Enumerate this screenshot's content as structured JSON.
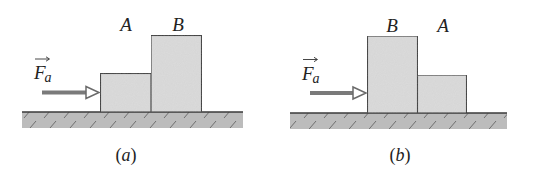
{
  "figure": {
    "colors": {
      "block_fill": "#d9d9d9",
      "block_stroke": "#3a3a3a",
      "ground_fill": "#b8b8b8",
      "hatch": "#6e6e6e",
      "arrow": "#7a7a7a",
      "text": "#222222"
    },
    "panels": [
      {
        "id": "a",
        "caption": "(a)",
        "caption_letter": "a",
        "force_label": "F",
        "force_subscript": "a",
        "blocks": [
          {
            "name": "A",
            "label": "A",
            "size": "small",
            "order": 1
          },
          {
            "name": "B",
            "label": "B",
            "size": "large",
            "order": 2
          }
        ]
      },
      {
        "id": "b",
        "caption": "(b)",
        "caption_letter": "b",
        "force_label": "F",
        "force_subscript": "a",
        "blocks": [
          {
            "name": "B",
            "label": "B",
            "size": "large",
            "order": 1
          },
          {
            "name": "A",
            "label": "A",
            "size": "small",
            "order": 2
          }
        ]
      }
    ]
  }
}
